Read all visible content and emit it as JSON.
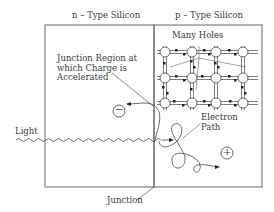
{
  "diagram": {
    "left_region": {
      "title": "n – Type Silicon"
    },
    "right_region": {
      "title": "p – Type Silicon"
    },
    "labels": {
      "junction_region_line1": "Junction Region at",
      "junction_region_line2": "which Charge is",
      "junction_region_line3": "Accelerated",
      "many_holes": "Many Holes",
      "light": "Light",
      "electron_line1": "Electron",
      "electron_line2": "Path",
      "junction": "Junction"
    },
    "symbols": {
      "negative_charge": "−",
      "positive_charge": "+"
    },
    "colors": {
      "line": "#555555",
      "text": "#3a3a3a",
      "background": "#ffffff"
    }
  }
}
